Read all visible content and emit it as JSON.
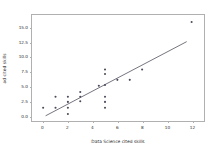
{
  "chart_data": {
    "type": "scatter",
    "title": "",
    "xlabel": "Data Science cited skills",
    "ylabel": "ad cited skills",
    "xlim": [
      -0.9,
      13.0
    ],
    "ylim": [
      -1.1,
      17.2
    ],
    "xticks": [
      0,
      2,
      4,
      6,
      8,
      10,
      12
    ],
    "xtick_labels": [
      "0",
      "2",
      "4",
      "6",
      "8",
      "10",
      "12"
    ],
    "yticks": [
      0.0,
      2.5,
      5.0,
      7.5,
      10.0,
      12.5,
      15.0
    ],
    "ytick_labels": [
      "0.0",
      "2.5",
      "5.0",
      "7.5",
      "10.0",
      "12.5",
      "15.0"
    ],
    "grid": false,
    "legend": false,
    "marker_color": "#4a4a5a",
    "line_color": "#3a3a48",
    "points": [
      {
        "x": 0,
        "y": 1.2
      },
      {
        "x": 1,
        "y": 1.2
      },
      {
        "x": 1,
        "y": 3.1
      },
      {
        "x": 2,
        "y": 0.1
      },
      {
        "x": 2,
        "y": 1.2
      },
      {
        "x": 2,
        "y": 2.2
      },
      {
        "x": 2,
        "y": 3.1
      },
      {
        "x": 3,
        "y": 2.3
      },
      {
        "x": 3,
        "y": 3.1
      },
      {
        "x": 3,
        "y": 3.9
      },
      {
        "x": 4.5,
        "y": 5.0
      },
      {
        "x": 5,
        "y": 1.2
      },
      {
        "x": 5,
        "y": 2.2
      },
      {
        "x": 5,
        "y": 3.1
      },
      {
        "x": 5,
        "y": 5.1
      },
      {
        "x": 5,
        "y": 7.0
      },
      {
        "x": 5,
        "y": 7.8
      },
      {
        "x": 6,
        "y": 6.0
      },
      {
        "x": 7,
        "y": 6.0
      },
      {
        "x": 8,
        "y": 7.8
      },
      {
        "x": 12,
        "y": 16.0
      }
    ],
    "fit_line": {
      "x_start": 0.2,
      "y_start": -0.2,
      "x_end": 11.6,
      "y_end": 12.6
    }
  }
}
